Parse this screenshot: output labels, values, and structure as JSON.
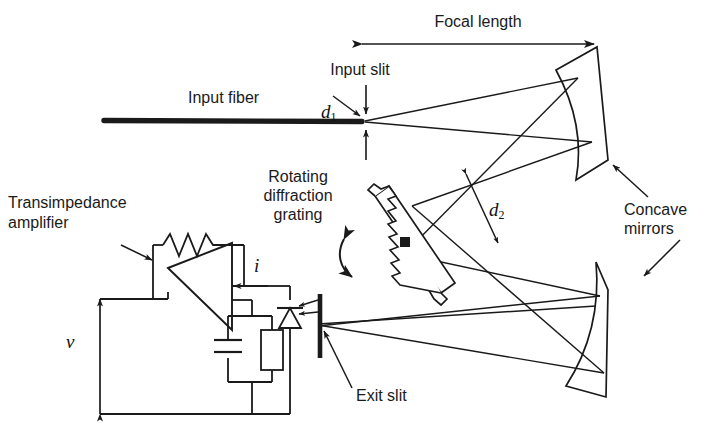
{
  "figure": {
    "type": "optical-schematic",
    "title_visible": false,
    "background_color": "#ffffff",
    "line_color": "#1a1a1a"
  },
  "labels": {
    "focal_length": "Focal length",
    "input_slit": "Input slit",
    "input_fiber": "Input fiber",
    "rotating_grating_line1": "Rotating",
    "rotating_grating_line2": "diffraction",
    "rotating_grating_line3": "grating",
    "concave_mirrors_line1": "Concave",
    "concave_mirrors_line2": "mirrors",
    "transimpedance_line1": "Transimpedance",
    "transimpedance_line2": "amplifier",
    "exit_slit": "Exit slit"
  },
  "symbols": {
    "d1_base": "d",
    "d1_sub": "1",
    "d2_base": "d",
    "d2_sub": "2",
    "current": "i",
    "voltage": "v"
  },
  "components": [
    {
      "name": "input-fiber",
      "kind": "fiber",
      "label": "Input fiber"
    },
    {
      "name": "input-slit",
      "kind": "slit",
      "label": "Input slit",
      "dimension": "d1"
    },
    {
      "name": "upper-concave-mirror",
      "kind": "mirror",
      "label": "Concave mirrors"
    },
    {
      "name": "lower-concave-mirror",
      "kind": "mirror",
      "label": "Concave mirrors"
    },
    {
      "name": "rotating-diffraction-grating",
      "kind": "grating",
      "label": "Rotating diffraction grating",
      "beam_width": "d2"
    },
    {
      "name": "exit-slit",
      "kind": "slit",
      "label": "Exit slit"
    },
    {
      "name": "photodiode",
      "kind": "diode",
      "label": ""
    },
    {
      "name": "transimpedance-amplifier",
      "kind": "opamp",
      "label": "Transimpedance amplifier",
      "current": "i",
      "voltage": "v"
    },
    {
      "name": "feedback-resistor",
      "kind": "resistor",
      "label": ""
    },
    {
      "name": "feedback-capacitor",
      "kind": "capacitor",
      "label": ""
    },
    {
      "name": "load-resistor",
      "kind": "resistor",
      "label": ""
    }
  ]
}
